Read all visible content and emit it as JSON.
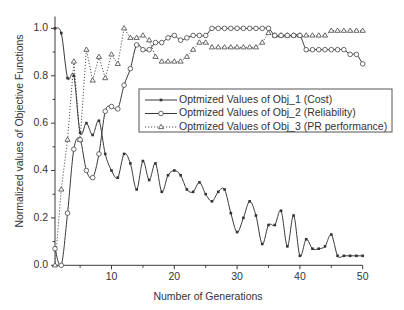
{
  "chart_data": {
    "type": "line",
    "title": "",
    "xlabel": "Number of Generations",
    "ylabel": "Normalized values of Objective Functions",
    "xlim": [
      1,
      50
    ],
    "ylim": [
      0,
      1.05
    ],
    "grid": false,
    "legend_position": "center-right",
    "x_major_ticks": [
      10,
      20,
      30,
      40,
      50
    ],
    "x_minor_ticks": [
      5,
      15,
      25,
      35,
      45
    ],
    "x_tick_labels": [
      "10",
      "20",
      "30",
      "40",
      "50"
    ],
    "y_major_ticks": [
      0.0,
      0.2,
      0.4,
      0.6,
      0.8,
      1.0
    ],
    "y_minor_ticks": [
      0.1,
      0.3,
      0.5,
      0.7,
      0.9
    ],
    "y_tick_labels": [
      "0.0",
      "0.2",
      "0.4",
      "0.6",
      "0.8",
      "1.0"
    ],
    "x": [
      1,
      2,
      3,
      4,
      5,
      6,
      7,
      8,
      9,
      10,
      11,
      12,
      13,
      14,
      15,
      16,
      17,
      18,
      19,
      20,
      21,
      22,
      23,
      24,
      25,
      26,
      27,
      28,
      29,
      30,
      31,
      32,
      33,
      34,
      35,
      36,
      37,
      38,
      39,
      40,
      41,
      42,
      43,
      44,
      45,
      46,
      47,
      48,
      49,
      50
    ],
    "series": [
      {
        "name": "Optmized Values of Obj_1 (Cost)",
        "marker": "filled-square",
        "line": "solid-smooth",
        "values": [
          1.0,
          0.98,
          0.79,
          0.8,
          0.56,
          0.6,
          0.55,
          0.61,
          0.47,
          0.4,
          0.37,
          0.47,
          0.43,
          0.32,
          0.44,
          0.36,
          0.43,
          0.31,
          0.38,
          0.4,
          0.38,
          0.32,
          0.31,
          0.35,
          0.3,
          0.27,
          0.31,
          0.32,
          0.22,
          0.14,
          0.2,
          0.27,
          0.21,
          0.09,
          0.17,
          0.17,
          0.23,
          0.08,
          0.21,
          0.04,
          0.11,
          0.07,
          0.07,
          0.08,
          0.13,
          0.04,
          0.04,
          0.04,
          0.04,
          0.04
        ]
      },
      {
        "name": "Optmized Values of Obj_2 (Reliability)",
        "marker": "open-circle",
        "line": "solid-smooth",
        "values": [
          0.07,
          0.0,
          0.22,
          0.49,
          0.53,
          0.4,
          0.37,
          0.47,
          0.65,
          0.67,
          0.66,
          0.76,
          0.83,
          0.93,
          0.91,
          0.91,
          0.94,
          0.94,
          0.96,
          0.97,
          0.95,
          0.96,
          0.97,
          0.97,
          0.97,
          1.0,
          1.0,
          1.0,
          1.0,
          1.0,
          1.0,
          1.0,
          1.0,
          1.0,
          1.0,
          0.97,
          0.97,
          0.97,
          0.97,
          0.97,
          0.91,
          0.91,
          0.91,
          0.91,
          0.91,
          0.91,
          0.91,
          0.89,
          0.89,
          0.85
        ]
      },
      {
        "name": "Optmized Values of Obj_3 (PR performance)",
        "marker": "open-triangle",
        "line": "dotted",
        "values": [
          0.0,
          0.32,
          0.53,
          0.86,
          0.53,
          0.91,
          0.78,
          0.88,
          0.79,
          0.89,
          0.85,
          1.0,
          0.96,
          0.96,
          0.97,
          0.95,
          0.88,
          0.86,
          0.86,
          0.86,
          0.86,
          0.88,
          0.91,
          0.94,
          0.94,
          0.92,
          0.92,
          0.92,
          0.92,
          0.92,
          0.92,
          0.92,
          0.92,
          0.94,
          0.98,
          0.97,
          0.97,
          0.97,
          0.97,
          0.97,
          0.97,
          0.97,
          0.97,
          0.97,
          0.99,
          0.99,
          0.99,
          0.99,
          0.99,
          0.99
        ]
      }
    ]
  }
}
